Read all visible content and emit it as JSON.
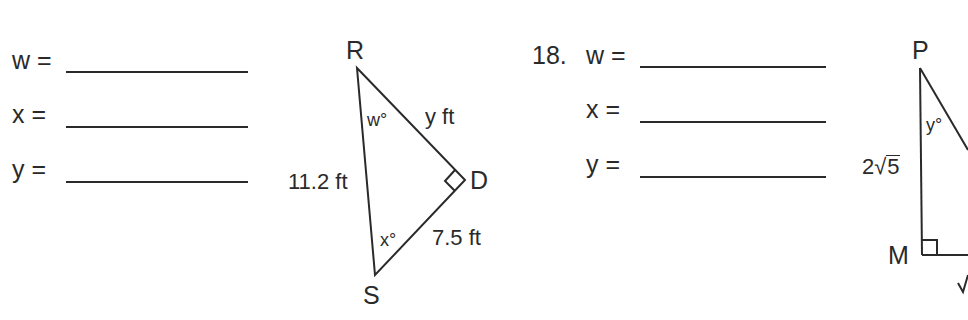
{
  "problem17": {
    "answers": [
      {
        "var": "w",
        "label": "w ="
      },
      {
        "var": "x",
        "label": "x ="
      },
      {
        "var": "y",
        "label": "y ="
      }
    ],
    "triangle": {
      "vertices": {
        "R": "R",
        "D": "D",
        "S": "S"
      },
      "sides": {
        "RS": "11.2 ft",
        "RD": "y ft",
        "DS": "7.5 ft"
      },
      "angles": {
        "R": "w°",
        "S": "x°"
      },
      "right_angle_at": "D"
    }
  },
  "problem18": {
    "number": "18.",
    "answers": [
      {
        "var": "w",
        "label": "w ="
      },
      {
        "var": "x",
        "label": "x ="
      },
      {
        "var": "y",
        "label": "y ="
      }
    ],
    "triangle": {
      "vertices": {
        "P": "P",
        "M": "M"
      },
      "sides": {
        "PM_coef": "2",
        "PM_radicand": "5"
      },
      "angles": {
        "P": "y°"
      },
      "right_angle_at": "M"
    }
  }
}
